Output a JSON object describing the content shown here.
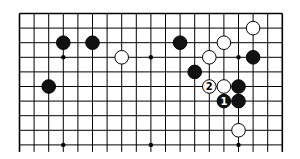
{
  "diagram": {
    "type": "go-board-fragment",
    "board_size": 19,
    "visible_rows": 10,
    "cut_off_edge": "bottom",
    "colors": {
      "background": "#ffffff",
      "line": "#000000",
      "black_stone": "#111111",
      "white_stone": "#ffffff"
    },
    "star_points": [
      [
        3,
        3
      ],
      [
        9,
        3
      ],
      [
        15,
        3
      ],
      [
        3,
        9
      ],
      [
        9,
        9
      ],
      [
        15,
        9
      ]
    ],
    "stones": [
      {
        "color": "black",
        "col": 3,
        "row": 2
      },
      {
        "color": "black",
        "col": 5,
        "row": 2
      },
      {
        "color": "white",
        "col": 7,
        "row": 3
      },
      {
        "color": "black",
        "col": 11,
        "row": 2
      },
      {
        "color": "black",
        "col": 2,
        "row": 5
      },
      {
        "color": "white",
        "col": 14,
        "row": 2
      },
      {
        "color": "white",
        "col": 16,
        "row": 1
      },
      {
        "color": "white",
        "col": 13,
        "row": 3
      },
      {
        "color": "black",
        "col": 16,
        "row": 3
      },
      {
        "color": "black",
        "col": 12,
        "row": 4
      },
      {
        "color": "white",
        "col": 13,
        "row": 5,
        "label": "2"
      },
      {
        "color": "white",
        "col": 14,
        "row": 5
      },
      {
        "color": "black",
        "col": 15,
        "row": 5
      },
      {
        "color": "black",
        "col": 14,
        "row": 6,
        "label": "1"
      },
      {
        "color": "black",
        "col": 15,
        "row": 6
      },
      {
        "color": "white",
        "col": 15,
        "row": 8
      }
    ]
  }
}
